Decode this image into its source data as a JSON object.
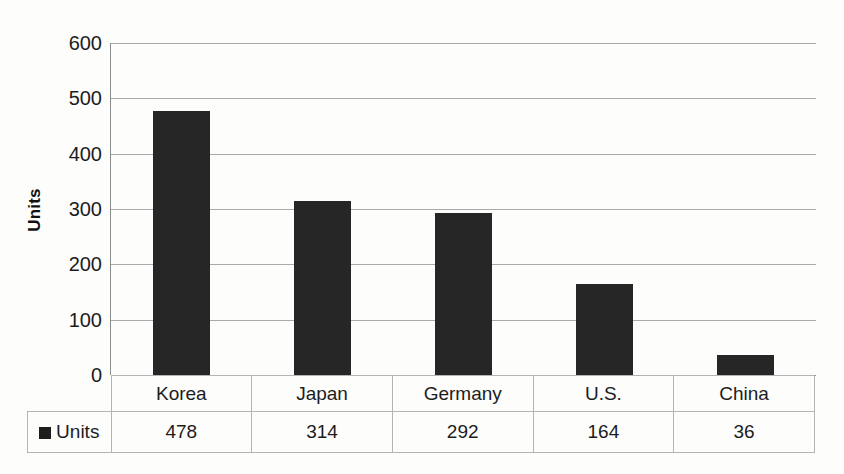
{
  "chart_data": {
    "type": "bar",
    "title": "",
    "xlabel": "",
    "ylabel": "Units",
    "categories": [
      "Korea",
      "Japan",
      "Germany",
      "U.S.",
      "China"
    ],
    "values": [
      478,
      314,
      292,
      164,
      36
    ],
    "series": [
      {
        "name": "Units",
        "values": [
          478,
          314,
          292,
          164,
          36
        ]
      }
    ],
    "ylim": [
      0,
      600
    ],
    "y_ticks": [
      0,
      100,
      200,
      300,
      400,
      500,
      600
    ],
    "y_tick_labels": [
      "0",
      "100",
      "200",
      "300",
      "400",
      "500",
      "600"
    ],
    "grid": true,
    "legend_position": "data-table-row",
    "legend_entries": [
      "Units"
    ],
    "bar_color": "#262626",
    "gridline_color": "#a9a9a9",
    "axis_color": "#8d8d8d",
    "background_color": "#fdfdfc"
  },
  "axis": {
    "y_title": "Units"
  },
  "table": {
    "legend_label": "Units",
    "headers": [
      "Korea",
      "Japan",
      "Germany",
      "U.S.",
      "China"
    ],
    "values": [
      "478",
      "314",
      "292",
      "164",
      "36"
    ]
  }
}
